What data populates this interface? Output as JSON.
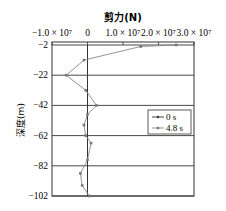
{
  "chart_data": {
    "type": "line",
    "title": "剪力(N)",
    "xlabel": "剪力(N)",
    "ylabel": "深度(m)",
    "x_axis_position": "top",
    "xlim": [
      -10000000.0,
      30000000.0
    ],
    "ylim": [
      -102,
      -2
    ],
    "x_tick_labels": [
      "−1.0 × 10⁷",
      "0",
      "1.0 × 10⁷",
      "2.0 × 10⁷",
      "3.0 × 10⁷"
    ],
    "x_ticks": [
      -10000000.0,
      0,
      10000000.0,
      20000000.0,
      30000000.0
    ],
    "y_tick_labels": [
      "−2",
      "−22",
      "−42",
      "−62",
      "−82",
      "−102"
    ],
    "y_ticks": [
      -2,
      -22,
      -42,
      -62,
      -82,
      -102
    ],
    "grid": "horizontal lines at y ticks",
    "legend": {
      "position": "right-middle",
      "entries": [
        "0 s",
        "4.8 s"
      ]
    },
    "series": [
      {
        "name": "0 s",
        "marker": "dot",
        "points": [
          {
            "x": 0,
            "y": -2
          },
          {
            "x": 0,
            "y": -22
          },
          {
            "x": 0,
            "y": -42
          },
          {
            "x": 0,
            "y": -62
          },
          {
            "x": 0,
            "y": -82
          },
          {
            "x": 0,
            "y": -102
          }
        ]
      },
      {
        "name": "4.8 s",
        "marker": "small-square",
        "points": [
          {
            "x": 25000000.0,
            "y": -2
          },
          {
            "x": 15000000.0,
            "y": -3
          },
          {
            "x": -1000000.0,
            "y": -12
          },
          {
            "x": -6000000.0,
            "y": -22
          },
          {
            "x": -500000.0,
            "y": -32
          },
          {
            "x": 2500000.0,
            "y": -42
          },
          {
            "x": 0.0,
            "y": -48
          },
          {
            "x": -1000000.0,
            "y": -55
          },
          {
            "x": -500000.0,
            "y": -62
          },
          {
            "x": 1000000.0,
            "y": -67
          },
          {
            "x": 0.0,
            "y": -78
          },
          {
            "x": -2000000.0,
            "y": -87
          },
          {
            "x": -1500000.0,
            "y": -95
          },
          {
            "x": 500000.0,
            "y": -102
          }
        ]
      }
    ]
  },
  "colors": {
    "axis": "#333333",
    "series_0s": "#333333",
    "series_48s": "#888888"
  }
}
